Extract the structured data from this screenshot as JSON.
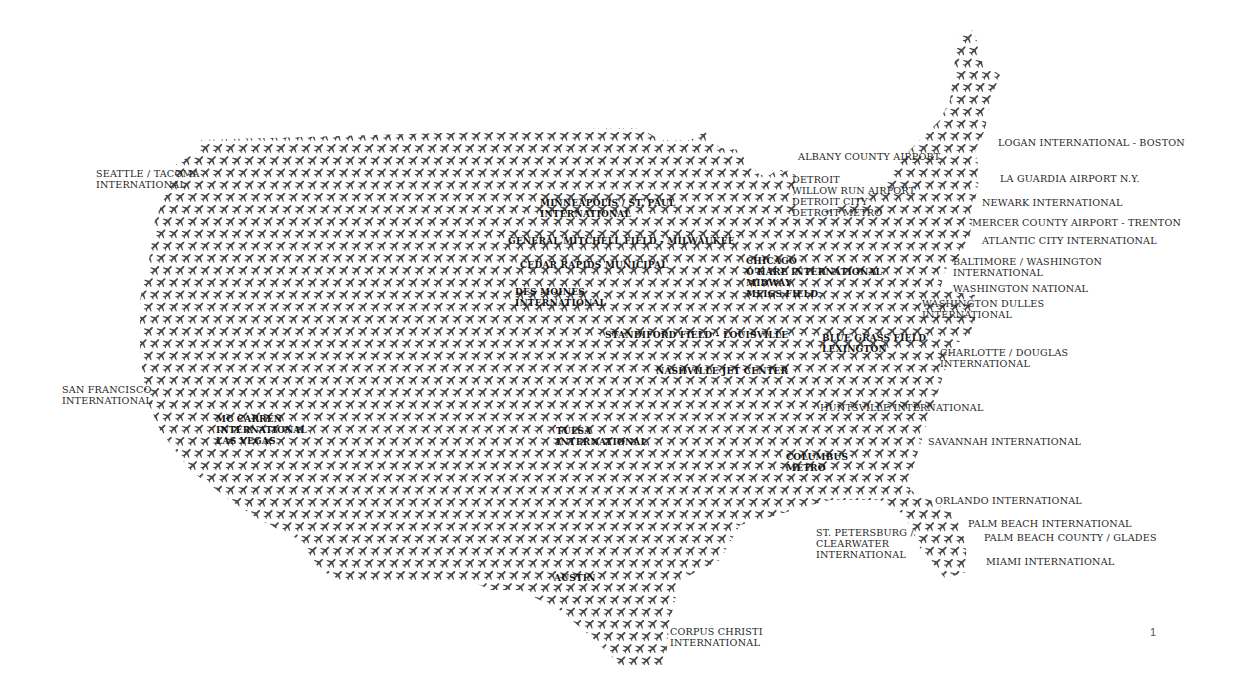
{
  "map": {
    "title_visible": false,
    "glyph": "airplane-icon",
    "glyph_color": "#4a4a4a",
    "background": "#ffffff"
  },
  "airports": [
    {
      "id": "seattle",
      "lines": "SEATTLE / TACOMA\nINTERNATIONAL",
      "x": 96,
      "y": 168,
      "inside": false
    },
    {
      "id": "san-francisco",
      "lines": "SAN FRANCISCO\nINTERNATIONAL",
      "x": 62,
      "y": 384,
      "inside": false
    },
    {
      "id": "las-vegas",
      "lines": "MC CARREN\nINTERNATIONAL\nLAS VEGAS",
      "x": 216,
      "y": 414,
      "inside": true
    },
    {
      "id": "minneapolis",
      "lines": "MINNEAPOLIS / ST. PAUL\nINTERNATIONAL",
      "x": 540,
      "y": 198,
      "inside": true
    },
    {
      "id": "milwaukee",
      "lines": "GENERAL MITCHELL FIELD - MILWAUKEE",
      "x": 508,
      "y": 236,
      "inside": true
    },
    {
      "id": "cedar-rapids",
      "lines": "CEDAR RAPIDS MUNICIPAL",
      "x": 520,
      "y": 260,
      "inside": true
    },
    {
      "id": "des-moines",
      "lines": "DES MOINES\nINTERNATIONAL",
      "x": 515,
      "y": 287,
      "inside": true
    },
    {
      "id": "louisville",
      "lines": "STANDIFORD FIELD - LOUISVILLE",
      "x": 605,
      "y": 330,
      "inside": true
    },
    {
      "id": "nashville",
      "lines": "NASHVILLE JET CENTER",
      "x": 656,
      "y": 366,
      "inside": true
    },
    {
      "id": "tulsa",
      "lines": "TULSA\nINTERNATIONAL",
      "x": 556,
      "y": 426,
      "inside": true
    },
    {
      "id": "austin",
      "lines": "AUSTIN",
      "x": 554,
      "y": 573,
      "inside": true
    },
    {
      "id": "corpus-christi",
      "lines": "CORPUS CHRISTI\nINTERNATIONAL",
      "x": 670,
      "y": 626,
      "inside": false
    },
    {
      "id": "chicago",
      "lines": "CHICAGO\nO'HARE INTERNATIONAL\nMIDWAY\nMEIGS FIELD",
      "x": 746,
      "y": 256,
      "inside": true
    },
    {
      "id": "blue-grass",
      "lines": "BLUE GRASS FIELD\nLEXINGTON",
      "x": 822,
      "y": 333,
      "inside": true
    },
    {
      "id": "huntsville",
      "lines": "HUNTSVILLE INTERNATIONAL",
      "x": 820,
      "y": 402,
      "inside": false
    },
    {
      "id": "columbus",
      "lines": "COLUMBUS\nMETRO",
      "x": 786,
      "y": 452,
      "inside": true
    },
    {
      "id": "albany",
      "lines": "ALBANY COUNTY AIRPORT",
      "x": 798,
      "y": 151,
      "inside": false
    },
    {
      "id": "detroit",
      "lines": "DETROIT\nWILLOW RUN AIRPORT\nDETROIT CITY\nDETROIT METRO",
      "x": 792,
      "y": 174,
      "inside": false
    },
    {
      "id": "boston",
      "lines": "LOGAN INTERNATIONAL - BOSTON",
      "x": 998,
      "y": 137,
      "inside": false
    },
    {
      "id": "la-guardia",
      "lines": "LA GUARDIA AIRPORT N.Y.",
      "x": 1000,
      "y": 173,
      "inside": false
    },
    {
      "id": "newark",
      "lines": "NEWARK INTERNATIONAL",
      "x": 982,
      "y": 197,
      "inside": false
    },
    {
      "id": "trenton",
      "lines": "MERCER COUNTY AIRPORT - TRENTON",
      "x": 972,
      "y": 217,
      "inside": false
    },
    {
      "id": "atlantic-city",
      "lines": "ATLANTIC CITY INTERNATIONAL",
      "x": 982,
      "y": 235,
      "inside": false
    },
    {
      "id": "baltimore",
      "lines": "BALTIMORE / WASHINGTON\nINTERNATIONAL",
      "x": 953,
      "y": 256,
      "inside": false
    },
    {
      "id": "washington-national",
      "lines": "WASHINGTON NATIONAL",
      "x": 953,
      "y": 283,
      "inside": false
    },
    {
      "id": "dulles",
      "lines": "WASHINGTON DULLES\nINTERNATIONAL",
      "x": 922,
      "y": 298,
      "inside": false
    },
    {
      "id": "charlotte",
      "lines": "CHARLOTTE / DOUGLAS\nINTERNATIONAL",
      "x": 940,
      "y": 347,
      "inside": false
    },
    {
      "id": "savannah",
      "lines": "SAVANNAH INTERNATIONAL",
      "x": 928,
      "y": 436,
      "inside": false
    },
    {
      "id": "orlando",
      "lines": "ORLANDO INTERNATIONAL",
      "x": 935,
      "y": 495,
      "inside": false
    },
    {
      "id": "st-petersburg",
      "lines": "ST. PETERSBURG /\nCLEARWATER\nINTERNATIONAL",
      "x": 816,
      "y": 527,
      "inside": false
    },
    {
      "id": "palm-beach",
      "lines": "PALM BEACH INTERNATIONAL",
      "x": 968,
      "y": 518,
      "inside": false
    },
    {
      "id": "palm-beach-county",
      "lines": "PALM BEACH COUNTY / GLADES",
      "x": 984,
      "y": 532,
      "inside": false
    },
    {
      "id": "miami",
      "lines": "MIAMI INTERNATIONAL",
      "x": 986,
      "y": 556,
      "inside": false
    }
  ],
  "page": {
    "number": "1"
  }
}
